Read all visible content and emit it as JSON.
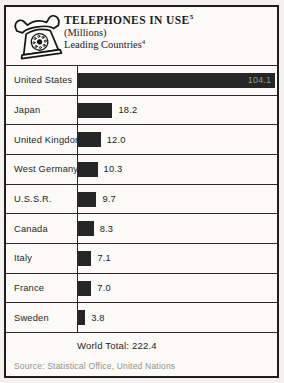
{
  "header": {
    "title": "TELEPHONES IN USE",
    "title_footnote": "5",
    "subtitle_units": "(Millions)",
    "subtitle_scope": "Leading Countries",
    "subtitle_scope_footnote": "4"
  },
  "chart_data": {
    "type": "bar",
    "orientation": "horizontal",
    "categories": [
      "United States",
      "Japan",
      "United Kingdom",
      "West Germany",
      "U.S.S.R.",
      "Canada",
      "Italy",
      "France",
      "Sweden"
    ],
    "values": [
      104.1,
      18.2,
      12.0,
      10.3,
      9.7,
      8.3,
      7.1,
      7.0,
      3.8
    ],
    "value_labels": [
      "104.1",
      "18.2",
      "12.0",
      "10.3",
      "9.7",
      "8.3",
      "7.1",
      "7.0",
      "3.8"
    ],
    "xlim": [
      0,
      105
    ],
    "grid": false,
    "legend": false,
    "bar_color": "#262626",
    "world_total": 222.4
  },
  "footer": {
    "world_total_label": "World Total: 222.4",
    "source": "Source: Statistical Office, United Nations"
  },
  "icon": {
    "name": "rotary-telephone-icon"
  }
}
